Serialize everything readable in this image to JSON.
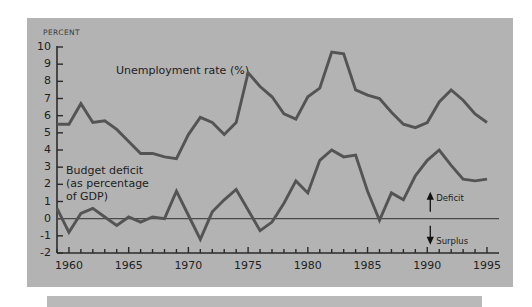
{
  "figure": {
    "axis_unit_label": "PERCENT",
    "panel_color": "#b3b3b3",
    "line_color": "#545454",
    "axis_color": "#2b2b2b",
    "text_color": "#1d1d1d"
  },
  "annotations": {
    "deficit": "Deficit",
    "surplus": "Surplus",
    "deficit_arrow": "up-arrow-icon",
    "surplus_arrow": "down-arrow-icon"
  },
  "chart_data": {
    "type": "line",
    "title": "",
    "xlabel": "",
    "ylabel": "PERCENT",
    "xlim": [
      1959,
      1995
    ],
    "ylim": [
      -2,
      10
    ],
    "grid": false,
    "zero_line": 0,
    "legend_position": "inline-annotations",
    "yticks": [
      10,
      9,
      8,
      7,
      6,
      5,
      4,
      3,
      2,
      1,
      0,
      -1,
      -2
    ],
    "ytick_labels": [
      "10",
      "9",
      "8",
      "7",
      "6",
      "5",
      "4",
      "3",
      "2",
      "1",
      "0",
      "-1",
      "-2"
    ],
    "xticks": [
      1959,
      1960,
      1961,
      1962,
      1963,
      1964,
      1965,
      1966,
      1967,
      1968,
      1969,
      1970,
      1971,
      1972,
      1973,
      1974,
      1975,
      1976,
      1977,
      1978,
      1979,
      1980,
      1981,
      1982,
      1983,
      1984,
      1985,
      1986,
      1987,
      1988,
      1989,
      1990,
      1991,
      1992,
      1993,
      1994,
      1995
    ],
    "xtick_labels_major": [
      "1960",
      "1965",
      "1970",
      "1975",
      "1980",
      "1985",
      "1990",
      "1995"
    ],
    "xticks_major": [
      1960,
      1965,
      1970,
      1975,
      1980,
      1985,
      1990,
      1995
    ],
    "series": [
      {
        "name": "Unemployment rate (%)",
        "label_text": "Unemployment rate (%)",
        "x": [
          1959,
          1960,
          1961,
          1962,
          1963,
          1964,
          1965,
          1966,
          1967,
          1968,
          1969,
          1970,
          1971,
          1972,
          1973,
          1974,
          1975,
          1976,
          1977,
          1978,
          1979,
          1980,
          1981,
          1982,
          1983,
          1984,
          1985,
          1986,
          1987,
          1988,
          1989,
          1990,
          1991,
          1992,
          1993,
          1994,
          1995
        ],
        "values": [
          5.5,
          5.5,
          6.7,
          5.6,
          5.7,
          5.2,
          4.5,
          3.8,
          3.8,
          3.6,
          3.5,
          4.9,
          5.9,
          5.6,
          4.9,
          5.6,
          8.5,
          7.7,
          7.1,
          6.1,
          5.8,
          7.1,
          7.6,
          9.7,
          9.6,
          7.5,
          7.2,
          7.0,
          6.2,
          5.5,
          5.3,
          5.6,
          6.8,
          7.5,
          6.9,
          6.1,
          5.6
        ]
      },
      {
        "name": "Budget deficit (as percentage of GDP)",
        "label_text": "Budget deficit\n(as percentage\nof GDP)",
        "x": [
          1959,
          1960,
          1961,
          1962,
          1963,
          1964,
          1965,
          1966,
          1967,
          1968,
          1969,
          1970,
          1971,
          1972,
          1973,
          1974,
          1975,
          1976,
          1977,
          1978,
          1979,
          1980,
          1981,
          1982,
          1983,
          1984,
          1985,
          1986,
          1987,
          1988,
          1989,
          1990,
          1991,
          1992,
          1993,
          1994,
          1995
        ],
        "values": [
          0.6,
          -0.8,
          0.3,
          0.6,
          0.1,
          -0.4,
          0.1,
          -0.2,
          0.1,
          0.0,
          1.6,
          0.2,
          -1.2,
          0.4,
          1.1,
          1.7,
          0.5,
          -0.7,
          -0.2,
          0.9,
          2.2,
          1.5,
          3.4,
          4.0,
          3.6,
          3.7,
          1.6,
          -0.1,
          1.5,
          1.1,
          2.5,
          3.4,
          4.0,
          3.1,
          2.3,
          2.2,
          2.3
        ]
      }
    ]
  }
}
